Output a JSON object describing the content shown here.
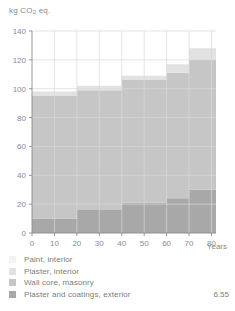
{
  "chart_data": {
    "type": "area",
    "title": "kg CO2 eq.",
    "title_parts": {
      "prefix": "kg CO",
      "sub": "2",
      "suffix": " eq."
    },
    "xlabel": "Years",
    "ylabel": "",
    "xlim": [
      0,
      82
    ],
    "ylim": [
      0,
      140
    ],
    "xticks": [
      0,
      10,
      20,
      30,
      40,
      50,
      60,
      70,
      80
    ],
    "yticks": [
      0,
      20,
      40,
      60,
      80,
      100,
      120,
      140
    ],
    "grid": true,
    "stacked": true,
    "step": "post",
    "x": [
      0,
      10,
      20,
      30,
      40,
      50,
      60,
      70,
      80,
      82
    ],
    "series": [
      {
        "name": "Plaster and coatings, exterior",
        "color": "#a8a8a8",
        "values": [
          10,
          10,
          16,
          16,
          21,
          21,
          24,
          30,
          30,
          30
        ]
      },
      {
        "name": "Wall core, masonry",
        "color": "#c6c6c6",
        "values": [
          85,
          85,
          83,
          83,
          85,
          85,
          87,
          90,
          90,
          90
        ]
      },
      {
        "name": "Plaster, interior",
        "color": "#e2e2e2",
        "values": [
          3,
          3,
          3,
          3,
          3,
          3,
          6,
          8,
          8,
          8
        ]
      },
      {
        "name": "Paint, interior",
        "color": "#f2f2f2",
        "values": [
          0,
          0,
          0,
          0,
          0,
          0,
          0,
          0,
          0,
          0
        ]
      }
    ],
    "cumulative_totals": [
      98,
      98,
      102,
      102,
      109,
      109,
      117,
      128,
      128,
      128
    ],
    "legend": {
      "position": "below",
      "entries": [
        {
          "label": "Paint, interior",
          "color": "#f2f2f2",
          "value": ""
        },
        {
          "label": "Plaster, interior",
          "color": "#e2e2e2",
          "value": ""
        },
        {
          "label": "Wall core, masonry",
          "color": "#c6c6c6",
          "value": ""
        },
        {
          "label": "Plaster and coatings, exterior",
          "color": "#a8a8a8",
          "value": "6.55"
        }
      ]
    },
    "colors": {
      "axis": "#8a8a8a",
      "grid": "#d9d9d9",
      "background": "#ffffff"
    }
  }
}
